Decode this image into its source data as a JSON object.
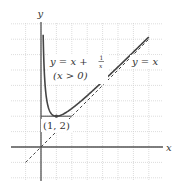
{
  "chart_data": {
    "type": "line",
    "title": "",
    "xlabel": "x",
    "ylabel": "y",
    "xlim": [
      -2,
      8
    ],
    "ylim": [
      -2,
      8
    ],
    "grid": true,
    "grid_step": 1,
    "series": [
      {
        "name": "y = x + 1/x (x > 0)",
        "style": "solid",
        "function": "x + 1/x",
        "domain": [
          0.14,
          7
        ],
        "color": "#444444"
      },
      {
        "name": "y = x",
        "style": "dashed",
        "function": "x",
        "domain": [
          -1,
          7
        ],
        "color": "#444444"
      }
    ],
    "annotations": [
      {
        "text": "(1, 2)",
        "point": [
          1,
          2
        ],
        "marker": true
      },
      {
        "text": "horizontal tangent segment",
        "from": [
          0,
          2
        ],
        "to": [
          2,
          2
        ]
      }
    ],
    "labels": {
      "curve_eq_lhs": "y = x +",
      "curve_frac_num": "1",
      "curve_frac_den": "x",
      "curve_cond": "(x > 0)",
      "line_eq": "y = x",
      "point": "(1, 2)",
      "x_axis": "x",
      "y_axis": "y"
    }
  }
}
